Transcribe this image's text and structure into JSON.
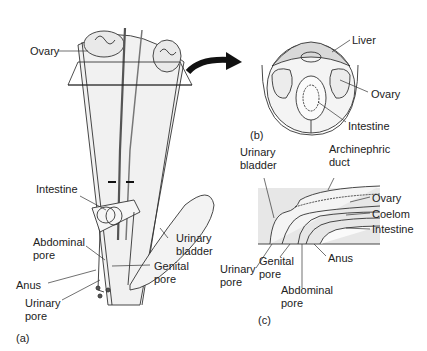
{
  "figure": {
    "panels": [
      {
        "id": "a",
        "label": "(a)"
      },
      {
        "id": "b",
        "label": "(b)"
      },
      {
        "id": "c",
        "label": "(c)"
      }
    ],
    "panel_a": {
      "labels": {
        "ovary": "Ovary",
        "intestine": "Intestine",
        "abdominal_pore_1": "Abdominal",
        "abdominal_pore_2": "pore",
        "anus": "Anus",
        "urinary_pore_1": "Urinary",
        "urinary_pore_2": "pore",
        "genital_pore_1": "Genital",
        "genital_pore_2": "pore",
        "urinary_bladder_1": "Urinary",
        "urinary_bladder_2": "bladder"
      }
    },
    "panel_b": {
      "labels": {
        "liver": "Liver",
        "ovary": "Ovary",
        "intestine": "Intestine"
      }
    },
    "panel_c": {
      "labels": {
        "urinary_bladder_1": "Urinary",
        "urinary_bladder_2": "bladder",
        "archinephric_duct_1": "Archinephric",
        "archinephric_duct_2": "duct",
        "ovary": "Ovary",
        "coelom": "Coelom",
        "intestine": "Intestine",
        "anus": "Anus",
        "urinary_pore_1": "Urinary",
        "urinary_pore_2": "pore",
        "genital_pore_1": "Genital",
        "genital_pore_2": "pore",
        "abdominal_pore_1": "Abdominal",
        "abdominal_pore_2": "pore"
      }
    }
  }
}
